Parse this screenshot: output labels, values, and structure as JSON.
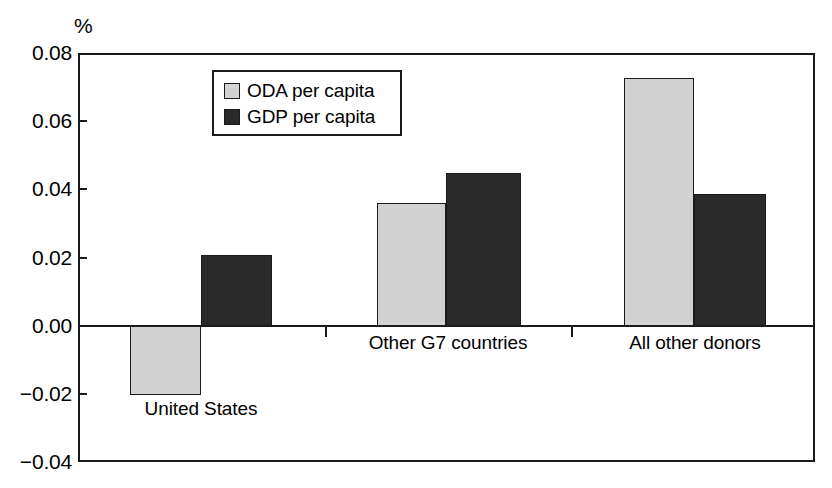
{
  "chart_data": {
    "type": "bar",
    "title": "",
    "subtitle": "",
    "xlabel": "",
    "ylabel": "%",
    "unit_label": "%",
    "categories": [
      "United States",
      "Other G7 countries",
      "All other donors"
    ],
    "series": [
      {
        "name": "ODA per capita",
        "color": "#d2d2d2",
        "values": [
          -0.0203,
          0.036,
          0.0727
        ]
      },
      {
        "name": "GDP per capita",
        "color": "#2a2a2a",
        "values": [
          0.0206,
          0.0448,
          0.0385
        ]
      }
    ],
    "ylim": [
      -0.04,
      0.08
    ],
    "yticks": [
      0.08,
      0.06,
      0.04,
      0.02,
      0.0,
      -0.02,
      -0.04
    ],
    "ytick_labels": [
      "0.08",
      "0.06",
      "0.04",
      "0.02",
      "0.00",
      "−0.02",
      "−0.04"
    ],
    "grid": false,
    "legend_position": "upper-left-inside",
    "zero_line": true,
    "frame": true
  },
  "legend": {
    "items": [
      {
        "label": "ODA per capita",
        "swatch": "oda"
      },
      {
        "label": "GDP per capita",
        "swatch": "gdp"
      }
    ]
  }
}
